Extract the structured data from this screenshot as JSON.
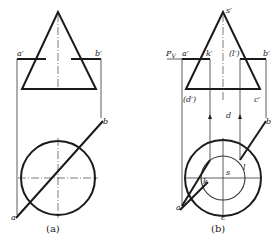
{
  "figure_a": {
    "caption": "(a)",
    "labels": {
      "a_prime": "a′",
      "b_prime": "b′",
      "a": "a",
      "b": "b"
    }
  },
  "figure_b": {
    "caption": "(b)",
    "labels": {
      "s_prime": "s′",
      "pv": "P",
      "pv_sub": "V",
      "a_prime": "a′",
      "k_prime": "k′",
      "l_prime": "(l′)",
      "b_prime": "b′",
      "d_prime": "(d′)",
      "c_prime": "c′",
      "d": "d",
      "s": "s",
      "l": "l",
      "k": "k",
      "c": "c",
      "a": "a",
      "b": "b"
    }
  },
  "colors": {
    "line": "#1a1a1a",
    "background": "#ffffff"
  }
}
